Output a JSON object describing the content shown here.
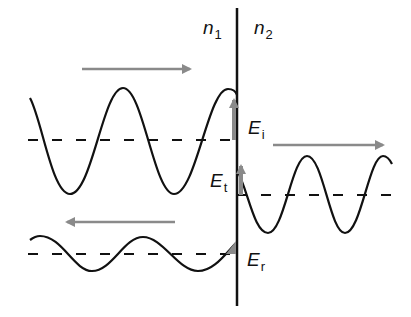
{
  "diagram": {
    "type": "wave reflection and transmission at interface",
    "colors": {
      "wave": "#111111",
      "interface": "#111111",
      "arrow": "#8a8a8a",
      "baseline": "#111111"
    },
    "labels": {
      "medium1": {
        "main": "n",
        "sub": "1"
      },
      "medium2": {
        "main": "n",
        "sub": "2"
      },
      "incident": {
        "main": "E",
        "sub": "i"
      },
      "transmitted": {
        "main": "E",
        "sub": "t"
      },
      "reflected": {
        "main": "E",
        "sub": "r"
      }
    },
    "waves": [
      {
        "name": "incident",
        "direction": "right",
        "amplitude": "large",
        "side": "n1"
      },
      {
        "name": "transmitted",
        "direction": "right",
        "amplitude": "large",
        "side": "n2"
      },
      {
        "name": "reflected",
        "direction": "left",
        "amplitude": "small",
        "side": "n1"
      }
    ]
  }
}
